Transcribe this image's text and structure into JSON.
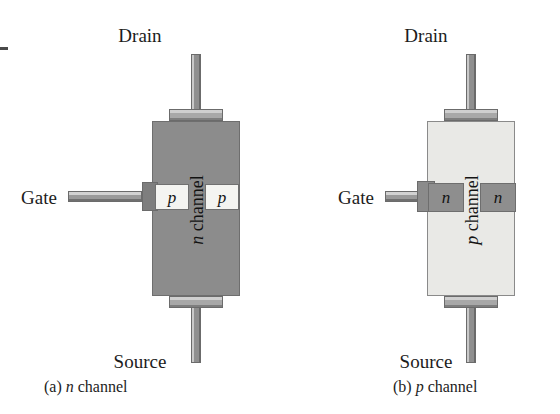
{
  "figure": {
    "background_color": "#ffffff",
    "edge_artifact": true
  },
  "panels": [
    {
      "id": "a",
      "caption_prefix": "(a)",
      "caption_symbol": "n",
      "caption_suffix": "channel",
      "channel_type": "n",
      "channel_label_symbol": "n",
      "channel_label_text": "channel",
      "gate_region_symbol": "p",
      "body_color": "#8c8c8c",
      "doped_region_color": "#f4f4f1",
      "terminals": {
        "drain": "Drain",
        "source": "Source",
        "gate": "Gate"
      }
    },
    {
      "id": "b",
      "caption_prefix": "(b)",
      "caption_symbol": "p",
      "caption_suffix": "channel",
      "channel_type": "p",
      "channel_label_symbol": "p",
      "channel_label_text": "channel",
      "gate_region_symbol": "n",
      "body_color": "#e9e9e6",
      "doped_region_color": "#8e8e8e",
      "terminals": {
        "drain": "Drain",
        "source": "Source",
        "gate": "Gate"
      }
    }
  ],
  "colors": {
    "lead_metal_light": "#d2d2d2",
    "lead_metal_mid": "#9a9a9a",
    "lead_metal_dark": "#6f6f6f",
    "outline": "#6b6b6b",
    "text": "#1c1c1c"
  }
}
